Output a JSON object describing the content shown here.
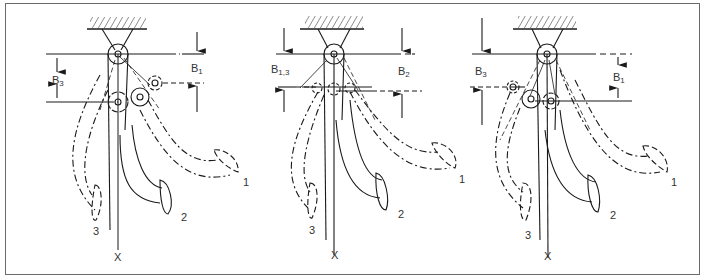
{
  "figure": {
    "panels": [
      {
        "id": "left",
        "dimension_labels": {
          "left": "B",
          "left_sub": "3",
          "right": "B",
          "right_sub": "1"
        },
        "pedal_labels": [
          "1",
          "2",
          "3"
        ],
        "axis_label": "X"
      },
      {
        "id": "middle",
        "dimension_labels": {
          "left": "B",
          "left_sub": "1,3",
          "right": "B",
          "right_sub": "2"
        },
        "pedal_labels": [
          "1",
          "2",
          "3"
        ],
        "axis_label": "X"
      },
      {
        "id": "right",
        "dimension_labels": {
          "left": "B",
          "left_sub": "3",
          "right": "B",
          "right_sub": "1"
        },
        "pedal_labels": [
          "1",
          "2",
          "3"
        ],
        "axis_label": "X"
      }
    ],
    "colors": {
      "line": "#1a1a1a",
      "frame": "#6a6a6a",
      "background": "#ffffff"
    }
  }
}
